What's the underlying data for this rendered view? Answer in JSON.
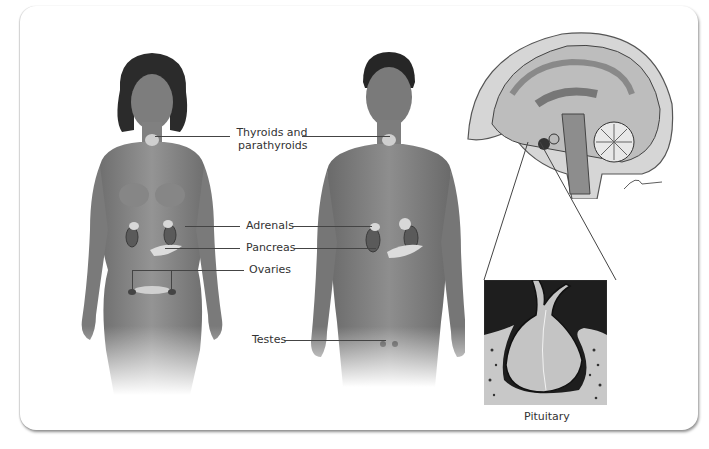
{
  "diagram": {
    "figures": [
      {
        "id": "female",
        "description": "female body with endocrine glands"
      },
      {
        "id": "male",
        "description": "male body with endocrine glands"
      },
      {
        "id": "brain",
        "description": "sagittal section of brain"
      },
      {
        "id": "pituitary-detail",
        "description": "magnified pituitary gland"
      }
    ],
    "labels": {
      "thyroids_line1": "Thyroids and",
      "thyroids_line2": "parathyroids",
      "adrenals": "Adrenals",
      "pancreas": "Pancreas",
      "ovaries": "Ovaries",
      "testes": "Testes",
      "pituitary": "Pituitary"
    },
    "colors": {
      "skin": "#8a8a8a",
      "hair": "#2a2a2a",
      "gland": "#d8d8d8",
      "leader_line": "#444444",
      "background": "#ffffff"
    }
  }
}
